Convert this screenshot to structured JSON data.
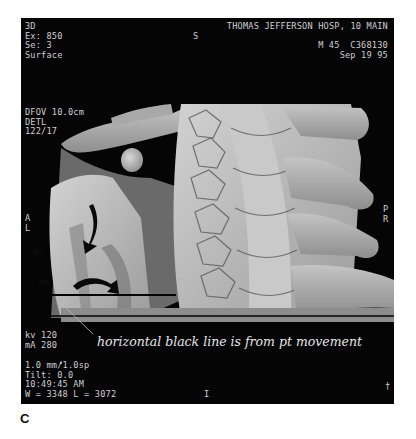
{
  "overlay": {
    "top_left": [
      "3D",
      "Ex: 850",
      "Se: 3",
      "Surface"
    ],
    "top_left_2": [
      "DFOV 10.0cm",
      "DETL",
      "122/17"
    ],
    "top_right": [
      "THOMAS JEFFERSON HOSP, 10 MAIN",
      "",
      "M 45  C368130",
      "Sep 19 95"
    ],
    "superior_marker": "S",
    "left_orientation": [
      "A",
      "L"
    ],
    "right_orientation": [
      "P",
      "R"
    ],
    "bottom_left_1": [
      "kv 120",
      "mA 280"
    ],
    "bottom_left_2": [
      "1.0 mm/1.0sp",
      "Tilt: 0.0",
      "10:49:45 AM",
      "W = 3348 L = 3072"
    ],
    "bottom_center_marker": "I",
    "bottom_right_marker": "†"
  },
  "annotation": "horizontal black line is from pt movement",
  "panel_label": "C",
  "colors": {
    "background": "#050505",
    "bone": "#b8b8b8",
    "overlay_text": "#cfcfcf"
  }
}
